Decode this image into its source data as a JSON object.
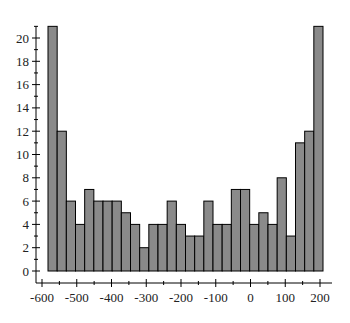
{
  "chart_data": {
    "type": "bar",
    "subtype": "histogram",
    "title": "",
    "xlabel": "",
    "ylabel": "",
    "bin_count": 30,
    "x_range": [
      -583,
      209
    ],
    "bin_width": 26.4,
    "values": [
      21,
      12,
      6,
      4,
      7,
      6,
      6,
      6,
      5,
      4,
      2,
      4,
      4,
      6,
      4,
      3,
      3,
      6,
      4,
      4,
      7,
      7,
      4,
      5,
      4,
      8,
      3,
      11,
      12,
      21
    ],
    "xlim": [
      -620,
      230
    ],
    "ylim": [
      0,
      21
    ],
    "x_ticks": [
      -600,
      -500,
      -400,
      -300,
      -200,
      -100,
      0,
      100,
      200
    ],
    "x_tick_labels": [
      "-600",
      "-500",
      "-400",
      "-300",
      "-200",
      "-100",
      "0",
      "100",
      "200"
    ],
    "y_ticks": [
      0,
      2,
      4,
      6,
      8,
      10,
      12,
      14,
      16,
      18,
      20
    ],
    "y_tick_labels": [
      "0",
      "2",
      "4",
      "6",
      "8",
      "10",
      "12",
      "14",
      "16",
      "18",
      "20"
    ],
    "grid": false,
    "legend": null,
    "colors": {
      "bar_fill": "#8a8a8a",
      "bar_stroke": "#000000",
      "axis": "#000000"
    }
  }
}
